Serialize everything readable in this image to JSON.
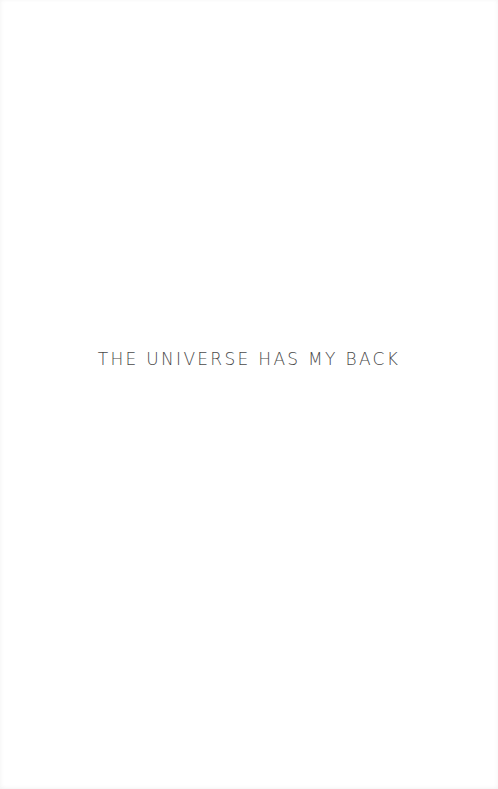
{
  "page": {
    "type": "book-title-page",
    "title": "THE UNIVERSE HAS MY BACK",
    "colors": {
      "background": "#ffffff",
      "text": "#4a4a4a"
    }
  }
}
